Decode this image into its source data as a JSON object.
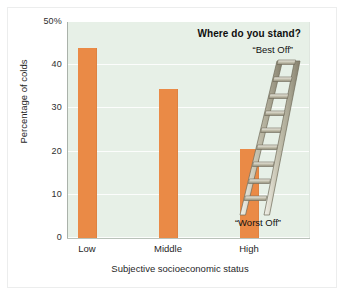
{
  "figure": {
    "background_color": "#ffffff",
    "plot_background_color": "#e7f0e7",
    "bar_color": "#ea8a46"
  },
  "annotation": {
    "title": "Where do you stand?",
    "top_label": "“Best Off”",
    "bottom_label": "“Worst Off”",
    "ladder_icon": "ladder-icon",
    "ladder_rungs": 9
  },
  "chart_data": {
    "type": "bar",
    "title": "",
    "categories": [
      "Low",
      "Middle",
      "High"
    ],
    "values": [
      44,
      34.5,
      20.5
    ],
    "xlabel": "Subjective socioeconomic status",
    "ylabel": "Percentage of colds",
    "ylim": [
      0,
      50
    ],
    "yticks": [
      0,
      10,
      20,
      30,
      40,
      50
    ],
    "ytick_labels": [
      "0",
      "10",
      "20",
      "30",
      "40",
      "50%"
    ],
    "grid": true,
    "grid_axis": "y",
    "legend": null,
    "legend_position": "none",
    "series": [
      {
        "name": "Percentage of colds",
        "values": [
          44,
          34.5,
          20.5
        ],
        "color": "#ea8a46"
      }
    ],
    "annotations": [
      "Where do you stand?",
      "“Best Off”",
      "“Worst Off”"
    ]
  }
}
